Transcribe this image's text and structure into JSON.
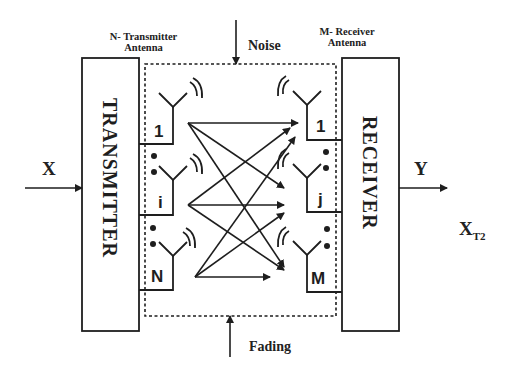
{
  "diagram": {
    "labels": {
      "tx_antenna": "N- Transmitter",
      "tx_antenna_line2": "Antenna",
      "rx_antenna": "M- Receiver",
      "rx_antenna_line2": "Antenna",
      "noise": "Noise",
      "fading": "Fading",
      "input": "X",
      "output": "Y",
      "extra": "X",
      "extra_sub": "T2"
    },
    "blocks": {
      "transmitter": "TRANSMITTER",
      "receiver": "RECEIVER"
    },
    "tx_antennas": [
      "1",
      "i",
      "N"
    ],
    "rx_antennas": [
      "1",
      "j",
      "M"
    ],
    "colors": {
      "line": "#1e1e1e",
      "background": "#ffffff"
    }
  }
}
